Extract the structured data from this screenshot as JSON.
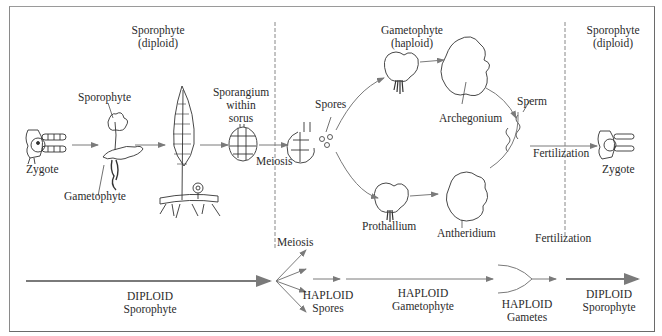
{
  "diagram": {
    "phases": [
      {
        "id": "sporophyte-left",
        "name": "Sporophyte",
        "ploidy": "(diploid)"
      },
      {
        "id": "gametophyte",
        "name": "Gametophyte",
        "ploidy": "(haploid)"
      },
      {
        "id": "sporophyte-right",
        "name": "Sporophyte",
        "ploidy": "(diploid)"
      }
    ],
    "stage_labels": {
      "zygote_left": "Zygote",
      "sporophyte_young": "Sporophyte",
      "gametophyte_young": "Gametophyte",
      "sporangium_1": "Sporangium",
      "sporangium_2": "within",
      "sporangium_3": "sorus",
      "meiosis_top": "Meiosis",
      "spores": "Spores",
      "archegonium": "Archegonium",
      "sperm": "Sperm",
      "prothallium": "Prothallium",
      "antheridium": "Antheridium",
      "fertilization_top": "Fertilization",
      "zygote_right": "Zygote"
    },
    "divider_labels": {
      "meiosis": "Meiosis",
      "fertilization": "Fertilization"
    },
    "timeline": [
      {
        "line1": "DIPLOID",
        "line2": "Sporophyte"
      },
      {
        "line1": "HAPLOID",
        "line2": "Spores"
      },
      {
        "line1": "HAPLOID",
        "line2": "Gametophyte"
      },
      {
        "line1": "HAPLOID",
        "line2": "Gametes"
      },
      {
        "line1": "DIPLOID",
        "line2": "Sporophyte"
      }
    ],
    "colors": {
      "ink": "#2b2b2b",
      "arrow": "#7a7a7a",
      "frame": "#6a6a6a",
      "background": "#ffffff"
    }
  }
}
